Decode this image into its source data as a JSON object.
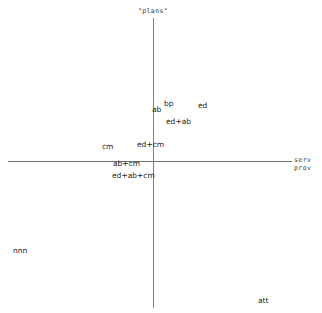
{
  "chart_data": {
    "type": "scatter",
    "title": "",
    "subtitle": "",
    "xlabel": "serv prov",
    "ylabel": "\"plans\"",
    "grid": false,
    "legend": null,
    "axes": {
      "origin_x": 153,
      "origin_y": 161,
      "vertical_axis": {
        "x": 153,
        "y_top": 18,
        "y_bottom": 308
      },
      "horizontal_axis": {
        "y": 161,
        "x_left": 8,
        "x_right": 292
      }
    },
    "axis_titles": {
      "y_top": "\"plans\"",
      "x_right_line1": "serv",
      "x_right_line2": "prov"
    },
    "points": [
      {
        "label": "bp",
        "x": 164,
        "y": 99,
        "quadrant": "upper-right"
      },
      {
        "label": "ed",
        "x": 198,
        "y": 101,
        "quadrant": "upper-right"
      },
      {
        "label": "ab",
        "x": 152,
        "y": 105,
        "quadrant": "upper-left"
      },
      {
        "label": "ed+ab",
        "x": 166,
        "y": 117,
        "quadrant": "upper-right"
      },
      {
        "label": "ed+cm",
        "x": 137,
        "y": 140,
        "quadrant": "upper-left"
      },
      {
        "label": "cm",
        "x": 102,
        "y": 142,
        "quadrant": "upper-left"
      },
      {
        "label": "ab+cm",
        "x": 113,
        "y": 159,
        "quadrant": "on-axis"
      },
      {
        "label": "ed+ab+cm",
        "x": 112,
        "y": 171,
        "quadrant": "lower-left"
      },
      {
        "label": "nnn",
        "x": 13,
        "y": 246,
        "quadrant": "lower-left"
      },
      {
        "label": "att",
        "x": 258,
        "y": 296,
        "quadrant": "lower-right"
      }
    ]
  }
}
